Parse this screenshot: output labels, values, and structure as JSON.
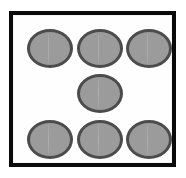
{
  "figure": {
    "type": "die-face",
    "pip_count": 7,
    "arrangement": "three-top-row, one-center, three-bottom-row",
    "colors": {
      "background": "#ffffff",
      "face_fill": "#fefefe",
      "frame_border": "#0a0a0a",
      "pip_fill": "#9b9b9b",
      "pip_outline": "#4c4c4c"
    },
    "frame": {
      "x": 9,
      "y": 11,
      "width": 167,
      "height": 156,
      "border_width": 4
    },
    "pips": [
      {
        "name": "pip-top-left",
        "row": "top",
        "column": "left",
        "x": 14,
        "y": 14,
        "width": 46,
        "height": 39
      },
      {
        "name": "pip-top-center",
        "row": "top",
        "column": "center",
        "x": 64,
        "y": 14,
        "width": 46,
        "height": 39
      },
      {
        "name": "pip-top-right",
        "row": "top",
        "column": "right",
        "x": 113,
        "y": 14,
        "width": 46,
        "height": 39
      },
      {
        "name": "pip-middle-center",
        "row": "middle",
        "column": "center",
        "x": 64,
        "y": 59,
        "width": 46,
        "height": 39
      },
      {
        "name": "pip-bottom-left",
        "row": "bottom",
        "column": "left",
        "x": 14,
        "y": 105,
        "width": 46,
        "height": 39
      },
      {
        "name": "pip-bottom-center",
        "row": "bottom",
        "column": "center",
        "x": 64,
        "y": 105,
        "width": 46,
        "height": 39
      },
      {
        "name": "pip-bottom-right",
        "row": "bottom",
        "column": "right",
        "x": 113,
        "y": 105,
        "width": 46,
        "height": 39
      }
    ]
  }
}
